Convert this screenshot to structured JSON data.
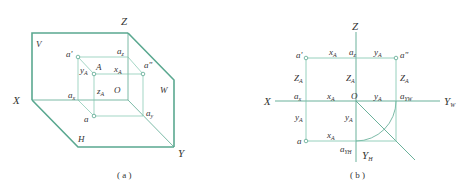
{
  "line_color": "#5aa890",
  "line_color_thin": "#7cc4ac",
  "diagram_a": {
    "caption": "( a )",
    "axes": {
      "x": "X",
      "y": "Y",
      "z": "Z"
    },
    "planes": {
      "v": "V",
      "h": "H",
      "w": "W"
    },
    "origin": "O",
    "point": "A",
    "labels": {
      "a_prime": "a'",
      "a_double_prime": "a\"",
      "a": "a",
      "a_x": "a",
      "a_x_sub": "x",
      "a_z": "a",
      "a_z_sub": "z",
      "a_y": "a",
      "a_y_sub": "y",
      "y_A": "y",
      "x_A": "x",
      "z_A": "z",
      "sub_A": "A"
    }
  },
  "diagram_b": {
    "caption": "( b )",
    "axes": {
      "x": "X",
      "z": "Z",
      "y_w": "Y",
      "y_w_sub": "W",
      "y_h": "Y",
      "y_h_sub": "H"
    },
    "origin": "O",
    "labels": {
      "a_prime": "a'",
      "a_double_prime": "a\"",
      "a": "a",
      "a_x": "a",
      "a_x_sub": "x",
      "a_z": "a",
      "a_z_sub": "z",
      "a_yw": "a",
      "a_yw_sub": "YW",
      "a_yh": "a",
      "a_yh_sub": "YH",
      "x_A": "x",
      "y_A": "y",
      "Z_A": "Z",
      "sub_A": "A"
    }
  }
}
